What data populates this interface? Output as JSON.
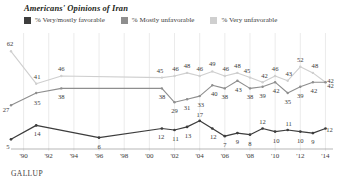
{
  "title": "Americans' Opinions of Iran",
  "source": "GALLUP",
  "legend": {
    "position": "top-left",
    "items": [
      {
        "label": "% Very/mostly favorable",
        "color": "#3d3d3d",
        "icon": "square-swatch"
      },
      {
        "label": "% Mostly unfavorable",
        "color": "#8e8e8e",
        "icon": "square-swatch"
      },
      {
        "label": "% Very unfavorable",
        "color": "#cfcfcf",
        "icon": "square-swatch"
      }
    ]
  },
  "chart_data": {
    "type": "line",
    "title": "Americans' Opinions of Iran",
    "xlabel": "",
    "ylabel": "",
    "ylim": [
      0,
      70
    ],
    "grid": "vertical",
    "legend_position": "top-left",
    "x": [
      1989,
      1991,
      1993,
      2001,
      2002,
      2003,
      2004,
      2005,
      2006,
      2007,
      2008,
      2009,
      2010,
      2011,
      2012,
      2013,
      2014
    ],
    "tick_labels": [
      "'90",
      "'92",
      "'94",
      "'96",
      "'98",
      "'00",
      "'02",
      "'04",
      "'06",
      "'08",
      "'10",
      "'12",
      "'14"
    ],
    "series": [
      {
        "name": "% Very/mostly favorable",
        "color": "#3d3d3d",
        "x": [
          1989,
          1991,
          1996,
          2001,
          2002,
          2003,
          2004,
          2005,
          2006,
          2007,
          2008,
          2009,
          2010,
          2011,
          2012,
          2013,
          2014
        ],
        "values": [
          5,
          14,
          6,
          12,
          11,
          13,
          17,
          12,
          7,
          9,
          8,
          12,
          10,
          11,
          10,
          9,
          12
        ]
      },
      {
        "name": "% Mostly unfavorable",
        "color": "#8e8e8e",
        "x": [
          1989,
          1991,
          1993,
          2001,
          2002,
          2003,
          2004,
          2005,
          2006,
          2007,
          2008,
          2009,
          2010,
          2011,
          2012,
          2013,
          2014
        ],
        "values": [
          27,
          35,
          38,
          38,
          29,
          31,
          33,
          40,
          38,
          43,
          38,
          39,
          42,
          35,
          39,
          42,
          42
        ]
      },
      {
        "name": "% Very unfavorable",
        "color": "#cfcfcf",
        "x": [
          1989,
          1991,
          1993,
          2001,
          2002,
          2003,
          2004,
          2005,
          2006,
          2007,
          2008,
          2009,
          2010,
          2011,
          2012,
          2013,
          2014
        ],
        "values": [
          62,
          41,
          46,
          45,
          46,
          48,
          46,
          49,
          46,
          48,
          45,
          42,
          46,
          43,
          52,
          48,
          42
        ]
      }
    ],
    "point_labels": {
      "favorable": [
        "5",
        "14",
        "6",
        "12",
        "11",
        "13",
        "17",
        "12",
        "7",
        "9",
        "8",
        "12",
        "10",
        "11",
        "10",
        "9",
        "12"
      ],
      "mostly_unfavorable": [
        "27",
        "35",
        "38",
        "38",
        "29",
        "31",
        "33",
        "40",
        "38",
        "43",
        "38",
        "39",
        "42",
        "35",
        "39",
        "42",
        "42"
      ],
      "very_unfavorable": [
        "62",
        "41",
        "46",
        "45",
        "46",
        "48",
        "46",
        "49",
        "46",
        "48",
        "45",
        "42",
        "46",
        "43",
        "52",
        "48",
        "42"
      ]
    }
  }
}
